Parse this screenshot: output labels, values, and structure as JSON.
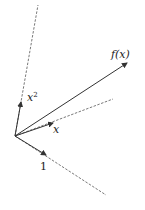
{
  "diagram": {
    "type": "vector-projection",
    "origin": [
      15,
      136
    ],
    "colors": {
      "stroke": "#333333",
      "dashed": "#555555",
      "background": "#ffffff"
    },
    "vectors": [
      {
        "id": "x2",
        "label_base": "x",
        "label_sup": "2",
        "tip": [
          20,
          106
        ],
        "dashed_end": [
          38,
          5
        ],
        "label_pos": [
          26,
          103
        ]
      },
      {
        "id": "fx",
        "label": "f(x)",
        "tip": [
          127,
          63
        ],
        "label_pos": [
          104,
          57
        ]
      },
      {
        "id": "x",
        "label": "x",
        "tip": [
          52,
          123
        ],
        "dashed_end": [
          113,
          99
        ],
        "label_pos": [
          51,
          133
        ]
      },
      {
        "id": "one",
        "label": "1",
        "tip": [
          45,
          153
        ],
        "dashed_end": [
          106,
          195
        ],
        "label_pos": [
          39,
          172
        ]
      }
    ]
  }
}
